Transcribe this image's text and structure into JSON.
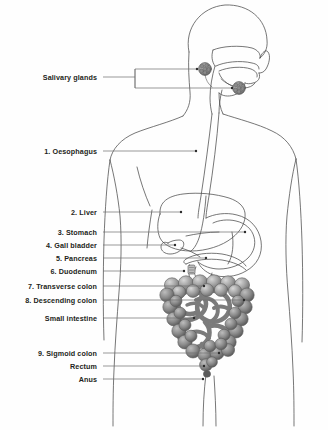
{
  "figure": {
    "background_color": "#fefefe",
    "line_color": "#3a3a3a",
    "label_color": "#231f20",
    "leader_color": "#6f6f6f",
    "organ_fill_colors": {
      "colon": "#9a9a9a",
      "colon_dark": "#6e6e6e",
      "small_intestine": "#c4c4c4",
      "gland": "#8f8f8f",
      "body": "none"
    }
  },
  "labels": [
    {
      "id": "salivary-glands",
      "text": "Salivary glands",
      "number": "",
      "x": 97,
      "y": 77,
      "leader": "bracket"
    },
    {
      "id": "oesophagus",
      "text": "1. Oesophagus",
      "number": "1",
      "x": 97,
      "y": 151,
      "leader": "line"
    },
    {
      "id": "liver",
      "text": "2. Liver",
      "number": "2",
      "x": 97,
      "y": 212,
      "leader": "line"
    },
    {
      "id": "stomach",
      "text": "3. Stomach",
      "number": "3",
      "x": 97,
      "y": 232,
      "leader": "line"
    },
    {
      "id": "gall-bladder",
      "text": "4. Gall bladder",
      "number": "4",
      "x": 97,
      "y": 245,
      "leader": "line"
    },
    {
      "id": "pancreas",
      "text": "5. Pancreas",
      "number": "5",
      "x": 97,
      "y": 258,
      "leader": "line"
    },
    {
      "id": "duodenum",
      "text": "6. Duodenum",
      "number": "6",
      "x": 97,
      "y": 271,
      "leader": "line"
    },
    {
      "id": "transverse-colon",
      "text": "7. Transverse colon",
      "number": "7",
      "x": 97,
      "y": 286,
      "leader": "line"
    },
    {
      "id": "descending-colon",
      "text": "8. Descending colon",
      "number": "8",
      "x": 97,
      "y": 300,
      "leader": "line"
    },
    {
      "id": "small-intestine",
      "text": "Small intestine",
      "number": "",
      "x": 97,
      "y": 318,
      "leader": "line"
    },
    {
      "id": "sigmoid-colon",
      "text": "9. Sigmoid colon",
      "number": "9",
      "x": 97,
      "y": 353,
      "leader": "line"
    },
    {
      "id": "rectum",
      "text": "Rectum",
      "number": "",
      "x": 97,
      "y": 366,
      "leader": "line"
    },
    {
      "id": "anus",
      "text": "Anus",
      "number": "",
      "x": 97,
      "y": 379,
      "leader": "line"
    }
  ],
  "leaders": [
    {
      "id": "salivary-upper",
      "x1": 135,
      "y1": 69,
      "x2": 197,
      "y2": 69
    },
    {
      "id": "salivary-lower",
      "x1": 135,
      "y1": 88,
      "x2": 232,
      "y2": 88
    },
    {
      "id": "oesophagus",
      "x1": 103,
      "y1": 151,
      "x2": 196,
      "y2": 151
    },
    {
      "id": "liver",
      "x1": 103,
      "y1": 212,
      "x2": 181,
      "y2": 212
    },
    {
      "id": "stomach",
      "x1": 103,
      "y1": 232,
      "x2": 245,
      "y2": 232
    },
    {
      "id": "gall-bladder",
      "x1": 103,
      "y1": 245,
      "x2": 175,
      "y2": 245
    },
    {
      "id": "pancreas",
      "x1": 103,
      "y1": 258,
      "x2": 206,
      "y2": 258
    },
    {
      "id": "duodenum",
      "x1": 103,
      "y1": 271,
      "x2": 184,
      "y2": 271
    },
    {
      "id": "transverse",
      "x1": 103,
      "y1": 286,
      "x2": 204,
      "y2": 286
    },
    {
      "id": "descending",
      "x1": 103,
      "y1": 300,
      "x2": 244,
      "y2": 300
    },
    {
      "id": "small-intestine",
      "x1": 103,
      "y1": 318,
      "x2": 194,
      "y2": 318
    },
    {
      "id": "sigmoid",
      "x1": 103,
      "y1": 353,
      "x2": 219,
      "y2": 353
    },
    {
      "id": "rectum",
      "x1": 103,
      "y1": 366,
      "x2": 204,
      "y2": 366
    },
    {
      "id": "anus",
      "x1": 103,
      "y1": 379,
      "x2": 203,
      "y2": 379
    }
  ],
  "organs": [
    {
      "id": "salivary-gland-parotid",
      "name": "parotid salivary gland"
    },
    {
      "id": "salivary-gland-submandibular",
      "name": "submandibular salivary gland"
    },
    {
      "id": "oesophagus-tube",
      "name": "oesophagus"
    },
    {
      "id": "liver-shape",
      "name": "liver"
    },
    {
      "id": "stomach-shape",
      "name": "stomach"
    },
    {
      "id": "gall-bladder-shape",
      "name": "gall bladder"
    },
    {
      "id": "pancreas-shape",
      "name": "pancreas"
    },
    {
      "id": "duodenum-shape",
      "name": "duodenum"
    },
    {
      "id": "transverse-colon-shape",
      "name": "transverse colon"
    },
    {
      "id": "ascending-colon-shape",
      "name": "ascending colon"
    },
    {
      "id": "descending-colon-shape",
      "name": "descending colon"
    },
    {
      "id": "small-intestine-shape",
      "name": "small intestine"
    },
    {
      "id": "sigmoid-colon-shape",
      "name": "sigmoid colon"
    },
    {
      "id": "rectum-shape",
      "name": "rectum"
    },
    {
      "id": "anus-shape",
      "name": "anus"
    },
    {
      "id": "body-outline",
      "name": "human body outline"
    }
  ]
}
